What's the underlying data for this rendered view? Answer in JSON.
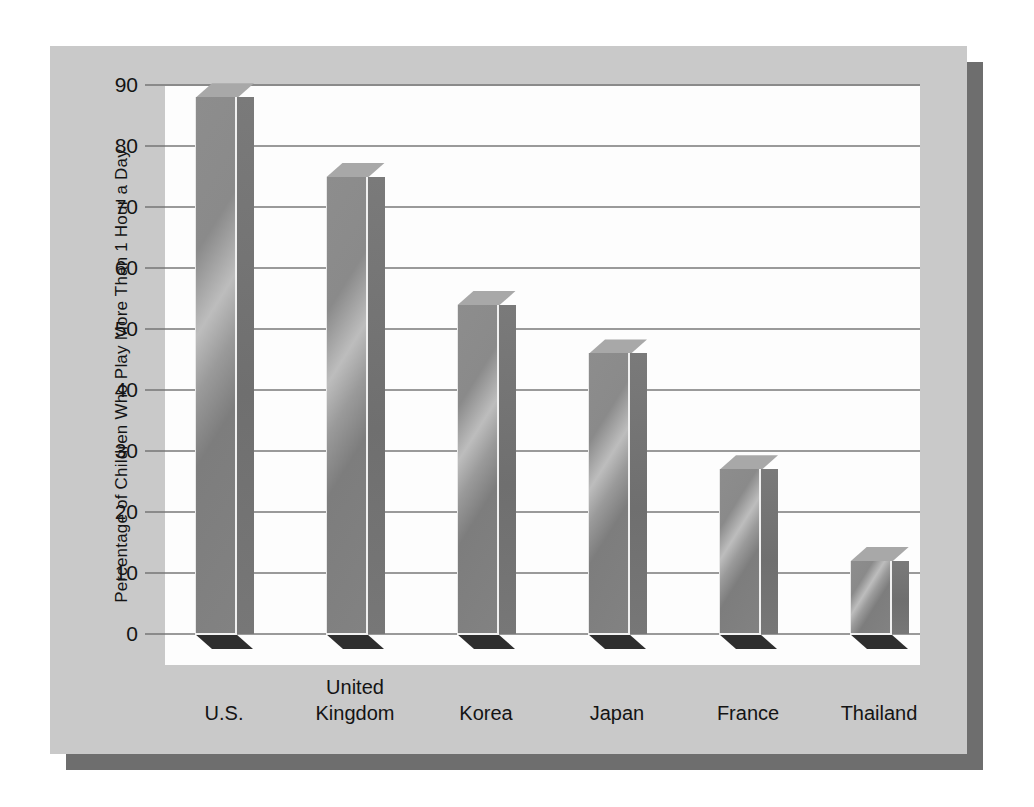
{
  "chart_data": {
    "type": "bar",
    "title": "",
    "xlabel": "",
    "ylabel": "Percentage of Children Who Play More Than 1 Hour a Day",
    "categories": [
      "U.S.",
      "United Kingdom",
      "Korea",
      "Japan",
      "France",
      "Thailand"
    ],
    "category_lines": [
      [
        "U.S."
      ],
      [
        "United",
        "Kingdom"
      ],
      [
        "Korea"
      ],
      [
        "Japan"
      ],
      [
        "France"
      ],
      [
        "Thailand"
      ]
    ],
    "values": [
      88,
      75,
      54,
      46,
      27,
      12
    ],
    "ylim": [
      0,
      90
    ],
    "yticks": [
      0,
      10,
      20,
      30,
      40,
      50,
      60,
      70,
      80,
      90
    ],
    "ytick_labels": [
      "0",
      "10",
      "20",
      "30",
      "40",
      "50",
      "60",
      "70",
      "80",
      "90"
    ],
    "grid": true,
    "legend": "none",
    "style": "3d-bar",
    "bar_color": "#8d8d8d",
    "panel_color": "#c9c9c9",
    "plot_bg_color": "#fdfdfd",
    "shadow_color": "#6e6e6e",
    "gridline_color": "#9a9a9a",
    "text_color": "#141414"
  }
}
